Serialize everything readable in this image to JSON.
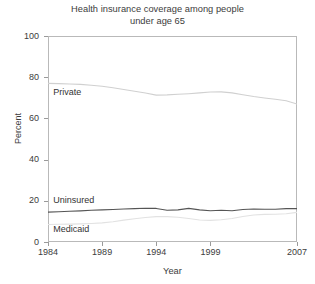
{
  "chart_data": {
    "type": "line",
    "title": "Health insurance coverage among people under age 65",
    "title_lines": [
      "Health insurance coverage among people",
      "under age 65"
    ],
    "xlabel": "Year",
    "ylabel": "Percent",
    "xlim": [
      1984,
      2007
    ],
    "ylim": [
      0,
      100
    ],
    "xticks": [
      1984,
      1989,
      1994,
      1999,
      2007
    ],
    "xtick_labels": [
      "1984",
      "1989",
      "1994",
      "1999",
      "2007"
    ],
    "yticks": [
      0,
      20,
      40,
      60,
      80,
      100
    ],
    "ytick_labels": [
      "0",
      "20",
      "40",
      "60",
      "80",
      "100"
    ],
    "grid": false,
    "legend_position": "inline-left",
    "x": [
      1984,
      1985,
      1986,
      1987,
      1988,
      1989,
      1990,
      1991,
      1992,
      1993,
      1994,
      1995,
      1996,
      1997,
      1998,
      1999,
      2000,
      2001,
      2002,
      2003,
      2004,
      2005,
      2006,
      2007
    ],
    "series": [
      {
        "name": "Private",
        "color": "#d0d0d0",
        "label": "Private",
        "values": [
          77.0,
          76.9,
          76.7,
          76.5,
          76.1,
          75.6,
          74.9,
          74.0,
          73.2,
          72.3,
          71.3,
          71.4,
          71.7,
          72.0,
          72.4,
          72.8,
          72.9,
          72.4,
          71.5,
          70.6,
          69.9,
          69.3,
          68.6,
          67.0
        ]
      },
      {
        "name": "Uninsured",
        "color": "#555555",
        "label": "Uninsured",
        "values": [
          14.5,
          14.7,
          14.9,
          15.1,
          15.4,
          15.6,
          15.8,
          16.0,
          16.2,
          16.4,
          16.3,
          15.4,
          15.6,
          16.3,
          15.6,
          15.2,
          15.4,
          15.2,
          15.8,
          16.0,
          15.9,
          15.9,
          16.2,
          16.2
        ]
      },
      {
        "name": "Medicaid",
        "color": "#e2e2e2",
        "label": "Medicaid",
        "values": [
          8.5,
          8.6,
          8.7,
          8.8,
          9.0,
          9.3,
          9.8,
          10.6,
          11.3,
          11.9,
          12.3,
          12.3,
          12.0,
          11.4,
          10.7,
          10.5,
          10.8,
          11.4,
          12.4,
          13.1,
          13.4,
          13.5,
          13.7,
          14.4
        ]
      }
    ],
    "annotations": [
      {
        "text": "Private",
        "x": 1984.3,
        "y": 72.5
      },
      {
        "text": "Uninsured",
        "x": 1984.3,
        "y": 20.0
      },
      {
        "text": "Medicaid",
        "x": 1984.3,
        "y": 6.0
      }
    ]
  },
  "footer": {
    "fragment": ""
  }
}
